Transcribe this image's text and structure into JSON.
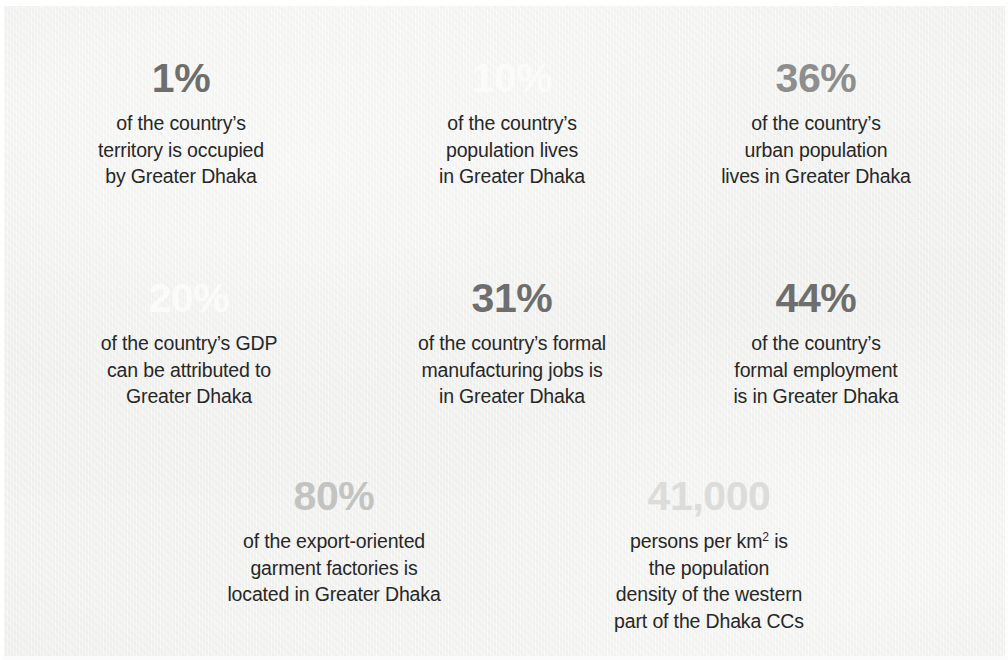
{
  "background": {
    "panel_color": "#f1f1ef",
    "border_color": "#ffffff"
  },
  "palette": {
    "body_text": "#272727",
    "value_dark": "#6e6e6e",
    "value_mid": "#8e8e8e",
    "value_light": "#c3c3c1",
    "value_faint": "#dcdcda",
    "value_white": "#fbfbfa"
  },
  "stats": [
    {
      "id": "territory",
      "value": "1%",
      "tone": "tone-dark",
      "lines": [
        "of the country’s",
        "territory is occupied",
        "by Greater Dhaka"
      ],
      "x": 177,
      "y": 52
    },
    {
      "id": "population",
      "value": "10%",
      "tone": "tone-white",
      "lines": [
        "of the country’s",
        "population lives",
        "in Greater Dhaka"
      ],
      "x": 508,
      "y": 52
    },
    {
      "id": "urban-population",
      "value": "36%",
      "tone": "tone-mid",
      "lines": [
        "of the country’s",
        "urban population",
        "lives in Greater Dhaka"
      ],
      "x": 812,
      "y": 52
    },
    {
      "id": "gdp",
      "value": "20%",
      "tone": "tone-white",
      "lines": [
        "of the country’s GDP",
        "can be attributed to",
        "Greater Dhaka"
      ],
      "x": 185,
      "y": 272
    },
    {
      "id": "manufacturing-jobs",
      "value": "31%",
      "tone": "tone-dark",
      "lines": [
        "of the country’s formal",
        "manufacturing jobs is",
        "in Greater Dhaka"
      ],
      "x": 508,
      "y": 272
    },
    {
      "id": "formal-employment",
      "value": "44%",
      "tone": "tone-dark",
      "lines": [
        "of the country’s",
        "formal employment",
        "is in Greater Dhaka"
      ],
      "x": 812,
      "y": 272
    },
    {
      "id": "garment-factories",
      "value": "80%",
      "tone": "tone-light",
      "lines": [
        "of the export-oriented",
        "garment factories is",
        "located in Greater Dhaka"
      ],
      "x": 330,
      "y": 470
    },
    {
      "id": "population-density",
      "value": "41,000",
      "tone": "tone-faint",
      "lines": [
        "persons per km² is",
        "the population",
        "density of the western",
        "part of the Dhaka CCs"
      ],
      "x": 705,
      "y": 470
    }
  ]
}
